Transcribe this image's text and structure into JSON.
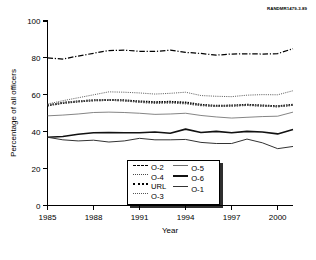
{
  "figure": {
    "source_note": "RANDMR1479-3.89"
  },
  "chart_data": {
    "type": "line",
    "title": "",
    "xlabel": "Year",
    "ylabel": "Percentage of all officers",
    "xlim": [
      1985,
      2001
    ],
    "ylim": [
      0,
      100
    ],
    "xticks": [
      1985,
      1988,
      1991,
      1994,
      1997,
      2000
    ],
    "yticks": [
      0,
      20,
      40,
      60,
      80,
      100
    ],
    "xtick_labels": [
      "1985",
      "1988",
      "1991",
      "1994",
      "1997",
      "2000"
    ],
    "ytick_labels": [
      "0",
      "20",
      "40",
      "60",
      "80",
      "100"
    ],
    "grid": false,
    "legend_position": "bottom-center",
    "x": [
      1985,
      1986,
      1987,
      1988,
      1989,
      1990,
      1991,
      1992,
      1993,
      1994,
      1995,
      1996,
      1997,
      1998,
      1999,
      2000,
      2001
    ],
    "series": [
      {
        "name": "O-2",
        "style": "dash-dot",
        "values": [
          80.0,
          79.4,
          81.0,
          82.5,
          84.0,
          84.2,
          83.6,
          83.5,
          84.2,
          83.0,
          82.4,
          81.5,
          82.1,
          82.2,
          82.1,
          82.3,
          85.0
        ]
      },
      {
        "name": "O-4",
        "style": "fine-dotted",
        "values": [
          55.0,
          56.8,
          58.4,
          60.0,
          61.6,
          61.4,
          61.0,
          60.4,
          60.8,
          61.4,
          59.6,
          59.2,
          59.0,
          59.8,
          60.1,
          60.0,
          62.2
        ]
      },
      {
        "name": "URL",
        "style": "thick-dotted",
        "values": [
          54.2,
          55.6,
          56.4,
          57.0,
          57.2,
          57.0,
          56.4,
          56.0,
          56.2,
          55.8,
          54.6,
          54.0,
          54.2,
          54.6,
          54.2,
          53.8,
          54.6
        ]
      },
      {
        "name": "O-3",
        "style": "dotted",
        "values": [
          54.4,
          55.8,
          56.5,
          57.1,
          57.3,
          56.8,
          56.0,
          55.4,
          55.6,
          55.2,
          54.2,
          53.8,
          54.0,
          54.3,
          54.0,
          53.6,
          54.4
        ]
      },
      {
        "name": "O-5",
        "style": "thin-solid",
        "values": [
          48.6,
          49.0,
          49.6,
          50.4,
          50.6,
          50.4,
          50.0,
          49.4,
          49.6,
          50.0,
          48.8,
          48.0,
          47.4,
          47.8,
          48.2,
          48.4,
          50.6
        ]
      },
      {
        "name": "O-6",
        "style": "thick-solid",
        "values": [
          37.0,
          37.4,
          38.6,
          39.4,
          39.6,
          39.4,
          39.4,
          39.8,
          39.2,
          41.4,
          39.6,
          40.2,
          39.4,
          40.2,
          39.8,
          38.8,
          41.2
        ]
      },
      {
        "name": "O-1",
        "style": "solid",
        "values": [
          37.0,
          35.6,
          35.0,
          35.4,
          34.4,
          35.0,
          36.4,
          35.6,
          35.6,
          35.8,
          34.2,
          33.6,
          33.6,
          36.0,
          34.0,
          30.8,
          32.0
        ]
      }
    ]
  },
  "legend": {
    "columns": [
      [
        {
          "label": "O-2",
          "style": "dash-dot"
        },
        {
          "label": "O-4",
          "style": "fine-dotted"
        },
        {
          "label": "URL",
          "style": "thick-dotted"
        },
        {
          "label": "O-3",
          "style": "dotted"
        }
      ],
      [
        {
          "label": "O-5",
          "style": "thin-solid"
        },
        {
          "label": "O-6",
          "style": "thick-solid"
        },
        {
          "label": "O-1",
          "style": "solid"
        }
      ]
    ]
  }
}
